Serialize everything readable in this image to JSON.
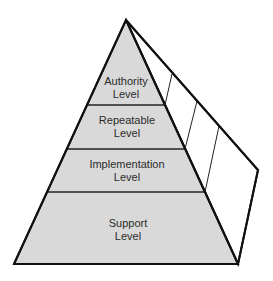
{
  "diagram": {
    "type": "pyramid",
    "colors": {
      "fill": "#d9d9d9",
      "side_fill": "#ffffff",
      "stroke": "#111111",
      "text": "#2b2b2b"
    },
    "levels": [
      {
        "line1": "Authority",
        "line2": "Level"
      },
      {
        "line1": "Repeatable",
        "line2": "Level"
      },
      {
        "line1": "Implementation",
        "line2": "Level"
      },
      {
        "line1": "Support",
        "line2": "Level"
      }
    ]
  }
}
